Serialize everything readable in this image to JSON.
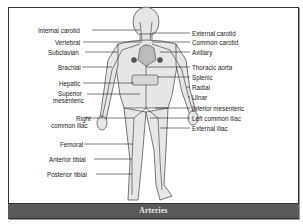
{
  "diagram": {
    "title": "Arteries",
    "left_labels": [
      {
        "text": "Internal carotid",
        "x": 38,
        "y": 27
      },
      {
        "text": "Vertebral",
        "x": 55,
        "y": 39
      },
      {
        "text": "Subclavian",
        "x": 48,
        "y": 49
      },
      {
        "text": "Brachial",
        "x": 58,
        "y": 64
      },
      {
        "text": "Hepatic",
        "x": 59,
        "y": 80
      },
      {
        "text": "Superior",
        "x": 58,
        "y": 90
      },
      {
        "text": "mesenteric",
        "x": 53,
        "y": 97
      },
      {
        "text": "Right",
        "x": 76,
        "y": 115
      },
      {
        "text": "common iliac",
        "x": 51,
        "y": 122
      },
      {
        "text": "Femoral",
        "x": 60,
        "y": 141
      },
      {
        "text": "Anterior tibial",
        "x": 49,
        "y": 156
      },
      {
        "text": "Posterior tibial",
        "x": 47,
        "y": 171
      }
    ],
    "right_labels": [
      {
        "text": "External carotid",
        "x": 192,
        "y": 30
      },
      {
        "text": "Common carotid",
        "x": 192,
        "y": 39
      },
      {
        "text": "Axillary",
        "x": 192,
        "y": 49
      },
      {
        "text": "Thoracic aorta",
        "x": 192,
        "y": 64
      },
      {
        "text": "Splenic",
        "x": 192,
        "y": 74
      },
      {
        "text": "Radial",
        "x": 192,
        "y": 84
      },
      {
        "text": "Ulnar",
        "x": 192,
        "y": 94
      },
      {
        "text": "Inferior mesenteric",
        "x": 192,
        "y": 105
      },
      {
        "text": "Left common iliac",
        "x": 192,
        "y": 115
      },
      {
        "text": "External iliac",
        "x": 192,
        "y": 125
      }
    ]
  }
}
